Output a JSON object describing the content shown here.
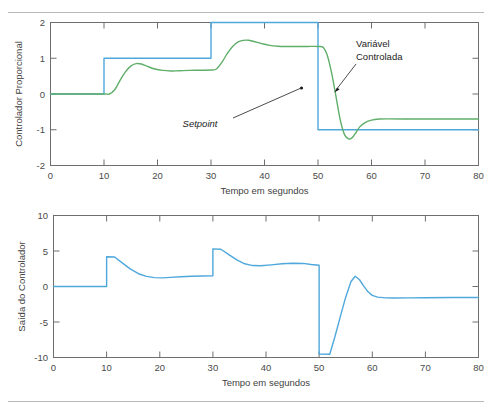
{
  "caption": {
    "top_partial_text": "",
    "show_top_rule": true,
    "show_bottom_rule": true
  },
  "colors": {
    "setpoint": "#4FA8DC",
    "controlled_variable": "#5FAF6A",
    "axis": "#6e6e6e",
    "text": "#3a3a3a",
    "rule": "#b8b8b8"
  },
  "annotations": {
    "setpoint_label": "Setpoint",
    "controlled_variable_label_line1": "Variável",
    "controlled_variable_label_line2": "Controlada"
  },
  "chart_data": [
    {
      "id": "chart-proportional-controller",
      "type": "line",
      "title": "",
      "xlabel": "Tempo em segundos",
      "ylabel": "Controlador Proporcional",
      "xlim": [
        0,
        80
      ],
      "ylim": [
        -2,
        2
      ],
      "xticks": [
        0,
        10,
        20,
        30,
        40,
        50,
        60,
        70,
        80
      ],
      "yticks": [
        2,
        1,
        0,
        -1,
        -2
      ],
      "xticklabels": [
        "0",
        "10",
        "20",
        "30",
        "40",
        "50",
        "60",
        "70",
        "80"
      ],
      "yticklabels": [
        "2",
        "1",
        "0",
        "-1",
        "-2"
      ],
      "grid": false,
      "legend": "none",
      "series": [
        {
          "name": "Setpoint",
          "color": "#4FA8DC",
          "style": "step",
          "points": [
            [
              0,
              0
            ],
            [
              10,
              0
            ],
            [
              10,
              1
            ],
            [
              30,
              1
            ],
            [
              30,
              2
            ],
            [
              50,
              2
            ],
            [
              50,
              -1
            ],
            [
              80,
              -1
            ]
          ]
        },
        {
          "name": "Variável Controlada",
          "color": "#5FAF6A",
          "style": "smooth",
          "points": [
            [
              0,
              0
            ],
            [
              9.8,
              0
            ],
            [
              11.0,
              0.0
            ],
            [
              12.0,
              0.12
            ],
            [
              13.0,
              0.38
            ],
            [
              14.0,
              0.62
            ],
            [
              15.0,
              0.78
            ],
            [
              16.0,
              0.85
            ],
            [
              17.0,
              0.84
            ],
            [
              18.0,
              0.78
            ],
            [
              19.5,
              0.7
            ],
            [
              21.0,
              0.66
            ],
            [
              22.5,
              0.645
            ],
            [
              24.0,
              0.65
            ],
            [
              26.0,
              0.66
            ],
            [
              28.0,
              0.665
            ],
            [
              30.0,
              0.67
            ],
            [
              31.0,
              0.7
            ],
            [
              32.0,
              0.88
            ],
            [
              33.0,
              1.12
            ],
            [
              34.0,
              1.32
            ],
            [
              35.0,
              1.45
            ],
            [
              36.0,
              1.5
            ],
            [
              37.0,
              1.505
            ],
            [
              38.0,
              1.47
            ],
            [
              39.5,
              1.41
            ],
            [
              41.0,
              1.36
            ],
            [
              42.5,
              1.335
            ],
            [
              44.0,
              1.328
            ],
            [
              46.0,
              1.33
            ],
            [
              48.0,
              1.33
            ],
            [
              50.0,
              1.33
            ],
            [
              51.0,
              1.3
            ],
            [
              51.8,
              1.05
            ],
            [
              52.6,
              0.55
            ],
            [
              53.4,
              -0.1
            ],
            [
              54.2,
              -0.75
            ],
            [
              55.0,
              -1.15
            ],
            [
              55.8,
              -1.26
            ],
            [
              56.4,
              -1.22
            ],
            [
              57.0,
              -1.1
            ],
            [
              57.8,
              -0.92
            ],
            [
              58.8,
              -0.8
            ],
            [
              60.0,
              -0.73
            ],
            [
              61.5,
              -0.7
            ],
            [
              63.0,
              -0.695
            ],
            [
              66.0,
              -0.7
            ],
            [
              70.0,
              -0.7
            ],
            [
              75.0,
              -0.7
            ],
            [
              80.0,
              -0.7
            ]
          ]
        }
      ],
      "annotations": [
        {
          "text": "Setpoint",
          "italic": true,
          "text_xy_px": [
            200,
            124
          ],
          "arrow_from_px": [
            233,
            118
          ],
          "arrow_to_px": [
            302,
            88
          ]
        },
        {
          "text_lines": [
            "Variável",
            "Controlada"
          ],
          "italic": false,
          "text_xy_px": [
            356,
            45
          ],
          "arrow_from_px": [
            354,
            66
          ],
          "arrow_to_px": [
            334,
            92
          ]
        }
      ]
    },
    {
      "id": "chart-controller-output",
      "type": "line",
      "title": "",
      "xlabel": "Tempo em segundos",
      "ylabel": "Saída do Controlador",
      "xlim": [
        0,
        80
      ],
      "ylim": [
        -10,
        10
      ],
      "xticks": [
        0,
        10,
        20,
        30,
        40,
        50,
        60,
        70,
        80
      ],
      "yticks": [
        10,
        5,
        0,
        -5,
        -10
      ],
      "xticklabels": [
        "0",
        "10",
        "20",
        "30",
        "40",
        "50",
        "60",
        "70",
        "80"
      ],
      "yticklabels": [
        "10",
        "5",
        "0",
        "-5",
        "-10"
      ],
      "grid": false,
      "legend": "none",
      "series": [
        {
          "name": "Saída do Controlador",
          "color": "#4FA8DC",
          "style": "mixed",
          "points": [
            [
              0,
              0
            ],
            [
              10,
              0
            ],
            [
              10,
              4.2
            ],
            [
              11.5,
              4.15
            ],
            [
              13.0,
              3.3
            ],
            [
              14.5,
              2.45
            ],
            [
              16.0,
              1.8
            ],
            [
              17.5,
              1.42
            ],
            [
              19.0,
              1.25
            ],
            [
              20.5,
              1.22
            ],
            [
              22.0,
              1.28
            ],
            [
              24.0,
              1.38
            ],
            [
              26.0,
              1.45
            ],
            [
              28.0,
              1.48
            ],
            [
              30.0,
              1.5
            ],
            [
              30.0,
              5.3
            ],
            [
              31.5,
              5.25
            ],
            [
              33.0,
              4.5
            ],
            [
              34.5,
              3.75
            ],
            [
              36.0,
              3.2
            ],
            [
              37.5,
              2.95
            ],
            [
              39.0,
              2.92
            ],
            [
              41.0,
              3.05
            ],
            [
              43.0,
              3.2
            ],
            [
              45.0,
              3.28
            ],
            [
              47.0,
              3.25
            ],
            [
              48.5,
              3.1
            ],
            [
              50.0,
              3.0
            ],
            [
              50.0,
              -9.5
            ],
            [
              52.0,
              -9.55
            ],
            [
              53.0,
              -7.0
            ],
            [
              54.0,
              -4.2
            ],
            [
              55.0,
              -1.5
            ],
            [
              56.0,
              0.7
            ],
            [
              56.8,
              1.45
            ],
            [
              57.6,
              0.95
            ],
            [
              58.4,
              0.05
            ],
            [
              59.2,
              -0.75
            ],
            [
              60.0,
              -1.25
            ],
            [
              61.0,
              -1.5
            ],
            [
              62.5,
              -1.6
            ],
            [
              64.0,
              -1.62
            ],
            [
              67.0,
              -1.6
            ],
            [
              70.0,
              -1.58
            ],
            [
              75.0,
              -1.55
            ],
            [
              80.0,
              -1.55
            ]
          ]
        }
      ],
      "annotations": []
    }
  ]
}
